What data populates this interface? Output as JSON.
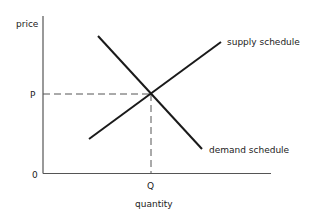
{
  "diagram": {
    "type": "supply-demand",
    "axes": {
      "y_label": "price",
      "x_label": "quantity",
      "origin_label": "0"
    },
    "equilibrium": {
      "price_label": "P",
      "quantity_label": "Q"
    },
    "curves": [
      {
        "name": "supply",
        "label": "supply schedule"
      },
      {
        "name": "demand",
        "label": "demand schedule"
      }
    ],
    "colors": {
      "line": "#1a1a1a",
      "axis": "#555555",
      "dashed": "#555555",
      "text": "#222222"
    }
  }
}
